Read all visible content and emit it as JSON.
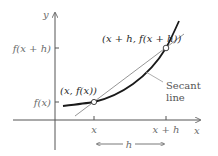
{
  "diagram": {
    "axes": {
      "x_label": "x",
      "y_label": "y"
    },
    "x_ticks": [
      {
        "label": "x",
        "pos": 94
      },
      {
        "label": "x + h",
        "pos": 166
      }
    ],
    "y_ticks": [
      {
        "label": "f(x + h)",
        "pos": 48
      },
      {
        "label": "f(x)",
        "pos": 102
      }
    ],
    "points": [
      {
        "label": "(x, f(x))"
      },
      {
        "label": "(x + h, f(x + h))"
      }
    ],
    "annotation": {
      "line1": "Secant",
      "line2": "line"
    },
    "interval": {
      "label": "h"
    },
    "colors": {
      "axis": "#555555",
      "curve": "#1a1a1a",
      "secant": "#8a8a8a",
      "text": "#6b6b6b"
    }
  }
}
